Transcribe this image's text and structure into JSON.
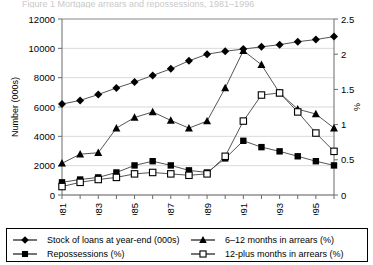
{
  "title_sliver": "Figure 1  Mortgage arrears and repossessions, 1981–1996",
  "axes": {
    "left_title": "Number (000s)",
    "right_title": "%",
    "left_ticks": [
      "0",
      "2000",
      "4000",
      "6000",
      "8000",
      "10000",
      "12000"
    ],
    "right_ticks": [
      "0",
      "0.5",
      "1",
      "1.5",
      "2",
      "2.5"
    ],
    "x_ticks_shown": [
      "1981",
      "1983",
      "1985",
      "1987",
      "1989",
      "1991",
      "1993",
      "1995"
    ]
  },
  "legend": {
    "items": [
      {
        "label": "Stock of loans at year-end (000s)",
        "marker": "filled-diamond-marker",
        "color": "#000000"
      },
      {
        "label": "6–12 months in arrears (%)",
        "marker": "filled-triangle-marker",
        "color": "#000000"
      },
      {
        "label": "Repossessions (%)",
        "marker": "filled-square-marker",
        "color": "#000000"
      },
      {
        "label": "12-plus months in arrears (%)",
        "marker": "open-square-marker",
        "color": "#000000"
      }
    ]
  },
  "chart_data": {
    "type": "line",
    "title": "Figure 1  Mortgage arrears and repossessions, 1981–1996",
    "xlabel": "",
    "ylabel": "Number (000s)",
    "y2label": "%",
    "grid": true,
    "legend_position": "bottom",
    "x": [
      1981,
      1982,
      1983,
      1984,
      1985,
      1986,
      1987,
      1988,
      1989,
      1990,
      1991,
      1992,
      1993,
      1994,
      1995,
      1996
    ],
    "xlim": [
      1981,
      1996
    ],
    "ylim": [
      0,
      12000
    ],
    "y2lim": [
      0,
      2.5
    ],
    "series": [
      {
        "name": "Stock of loans at year-end (000s)",
        "axis": "left",
        "marker": "filled-diamond",
        "values": [
          6200,
          6450,
          6850,
          7300,
          7700,
          8150,
          8600,
          9150,
          9600,
          9800,
          9950,
          10100,
          10250,
          10450,
          10600,
          10800
        ]
      },
      {
        "name": "6–12 months in arrears (%)",
        "axis": "right",
        "marker": "filled-triangle",
        "values": [
          0.45,
          0.58,
          0.6,
          0.95,
          1.1,
          1.18,
          1.06,
          0.95,
          1.05,
          1.52,
          2.05,
          1.85,
          1.45,
          1.22,
          1.15,
          0.95
        ]
      },
      {
        "name": "Repossessions (%)",
        "axis": "right",
        "marker": "filled-square",
        "values": [
          0.18,
          0.22,
          0.25,
          0.32,
          0.42,
          0.48,
          0.42,
          0.35,
          0.32,
          0.52,
          0.77,
          0.68,
          0.62,
          0.55,
          0.48,
          0.42
        ]
      },
      {
        "name": "12-plus months in arrears (%)",
        "axis": "right",
        "marker": "open-square",
        "values": [
          0.12,
          0.18,
          0.22,
          0.25,
          0.3,
          0.32,
          0.3,
          0.28,
          0.3,
          0.55,
          1.05,
          1.42,
          1.45,
          1.18,
          0.88,
          0.62
        ]
      }
    ]
  }
}
